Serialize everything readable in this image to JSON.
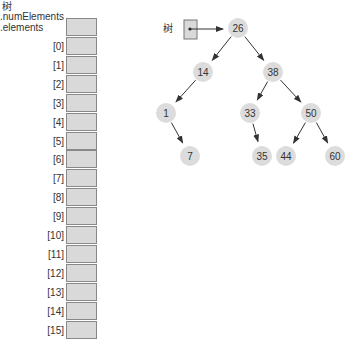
{
  "array": {
    "header_labels": [
      "树",
      ".numElements",
      ".elements"
    ],
    "indices": [
      "[0]",
      "[1]",
      "[2]",
      "[3]",
      "[4]",
      "[5]",
      "[6]",
      "[7]",
      "[8]",
      "[9]",
      "[10]",
      "[11]",
      "[12]",
      "[13]",
      "[14]",
      "[15]"
    ],
    "cell_color": "#d9d9d9"
  },
  "tree": {
    "pointer_label": "树",
    "root": "26",
    "nodes": [
      {
        "value": "26",
        "x": 238,
        "y": 28
      },
      {
        "value": "14",
        "x": 203,
        "y": 72
      },
      {
        "value": "38",
        "x": 273,
        "y": 72
      },
      {
        "value": "1",
        "x": 166,
        "y": 113
      },
      {
        "value": "33",
        "x": 250,
        "y": 113
      },
      {
        "value": "50",
        "x": 311,
        "y": 113
      },
      {
        "value": "7",
        "x": 190,
        "y": 156
      },
      {
        "value": "35",
        "x": 262,
        "y": 156
      },
      {
        "value": "44",
        "x": 286,
        "y": 156
      },
      {
        "value": "60",
        "x": 335,
        "y": 156
      }
    ],
    "node_color": "#dcdcdc"
  }
}
